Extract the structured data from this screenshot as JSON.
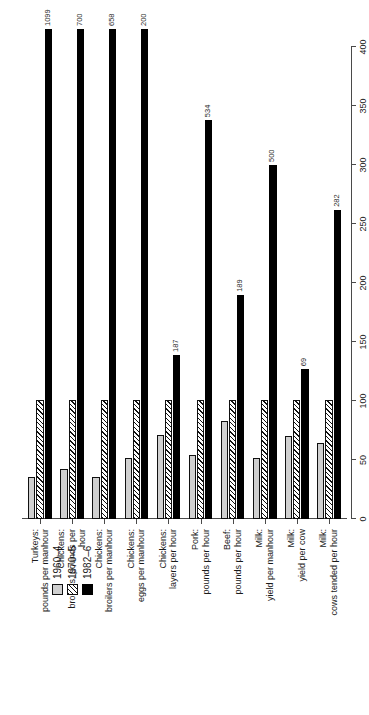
{
  "chart_data": {
    "type": "bar",
    "orientation": "horizontal",
    "title": "",
    "xlabel": "Index (1972–4 = 100)",
    "ylabel": "",
    "xlim": [
      0,
      400
    ],
    "xticks": [
      0,
      50,
      100,
      150,
      200,
      250,
      300,
      350,
      400
    ],
    "grid": false,
    "legend_position": "top-left",
    "categories": [
      {
        "line1": "Turkeys:",
        "line2": "pounds per manhour"
      },
      {
        "line1": "Chickens:",
        "line2": "broilers, pounds per",
        "line3": "hour"
      },
      {
        "line1": "Chickens:",
        "line2": "broilers per manhour"
      },
      {
        "line1": "Chickens:",
        "line2": "eggs per manhour"
      },
      {
        "line1": "Chickens:",
        "line2": "layers per hour"
      },
      {
        "line1": "Pork:",
        "line2": "pounds per hour"
      },
      {
        "line1": "Beef:",
        "line2": "pounds per hour"
      },
      {
        "line1": "Milk:",
        "line2": "yield per manhour"
      },
      {
        "line1": "Milk:",
        "line2": "yield  per cow"
      },
      {
        "line1": "Milk:",
        "line2": "cows tended per hour"
      }
    ],
    "series": [
      {
        "name": "1960–4",
        "style": "light-gray",
        "values": [
          36,
          42,
          36,
          52,
          71,
          54,
          83,
          52,
          70,
          64
        ]
      },
      {
        "name": "1970–5",
        "style": "hatched",
        "values": [
          101,
          102,
          101,
          101,
          101,
          101,
          101,
          101,
          101,
          101
        ]
      },
      {
        "name": "1982–6",
        "style": "black",
        "values": [
          1099,
          700,
          658,
          200,
          187,
          534,
          189,
          500,
          69,
          282
        ]
      }
    ],
    "value_labels": [
      {
        "category_index": 0,
        "series": "1982–6",
        "text": "1099",
        "clipped_at_axis_max": true
      },
      {
        "category_index": 1,
        "series": "1982–6",
        "text": "700",
        "clipped_at_axis_max": true
      },
      {
        "category_index": 2,
        "series": "1982–6",
        "text": "658",
        "clipped_at_axis_max": true
      },
      {
        "category_index": 3,
        "series": "1982–6",
        "text": "200",
        "clipped_at_axis_max": true
      },
      {
        "category_index": 4,
        "series": "1982–6",
        "text": "187",
        "clipped_at_axis_max": false
      },
      {
        "category_index": 5,
        "series": "1982–6",
        "text": "534",
        "clipped_at_axis_max": false
      },
      {
        "category_index": 6,
        "series": "1982–6",
        "text": "189",
        "clipped_at_axis_max": false
      },
      {
        "category_index": 7,
        "series": "1982–6",
        "text": "500",
        "clipped_at_axis_max": false
      },
      {
        "category_index": 8,
        "series": "1982–6",
        "text": "69",
        "clipped_at_axis_max": false
      },
      {
        "category_index": 9,
        "series": "1982–6",
        "text": "282",
        "clipped_at_axis_max": false
      }
    ],
    "plotted_lengths_index": {
      "comment": "on-canvas bar lengths in index units (long bars run off the 400 scale)",
      "series_1982_6": [
        432,
        432,
        432,
        432,
        139,
        338,
        190,
        300,
        127,
        262
      ],
      "series_1970_5": [
        101,
        101,
        101,
        101,
        101,
        101,
        101,
        101,
        101,
        101
      ],
      "series_1960_4": [
        36,
        42,
        36,
        52,
        71,
        54,
        83,
        52,
        70,
        64
      ]
    }
  },
  "legend": {
    "entries": [
      {
        "label": "1960–4",
        "swatch": "light-gray"
      },
      {
        "label": "1970–5",
        "swatch": "hatched"
      },
      {
        "label": "1982–6",
        "swatch": "black"
      }
    ]
  },
  "axis": {
    "title": "Index (1972–4 = 100)",
    "tick_labels": [
      "0",
      "50",
      "100",
      "150",
      "200",
      "250",
      "300",
      "350",
      "400"
    ]
  }
}
